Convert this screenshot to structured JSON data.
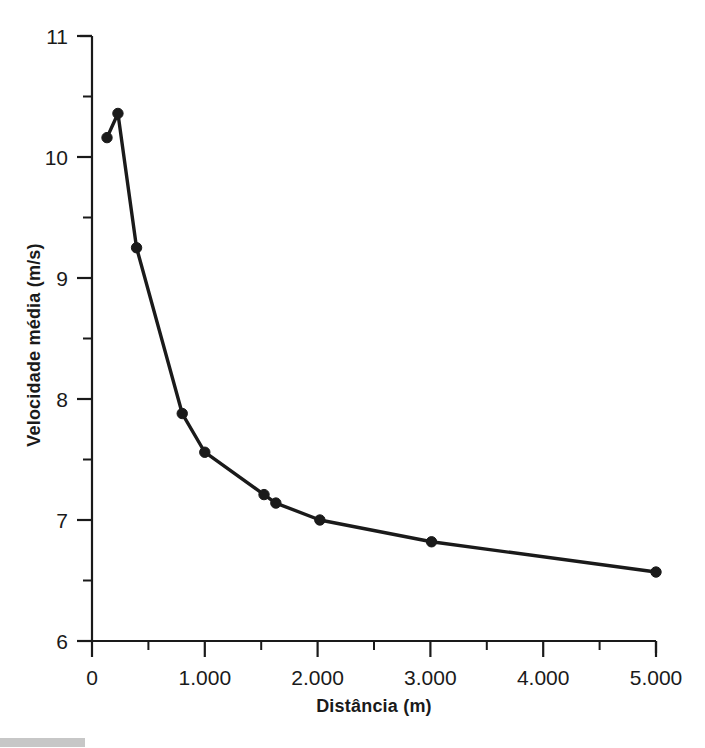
{
  "chart_data": {
    "type": "line",
    "title": "",
    "subtitle": "",
    "xlabel": "Distância (m)",
    "ylabel": "Velocidade média (m/s)",
    "xlim": [
      0,
      5000
    ],
    "ylim": [
      6,
      11
    ],
    "grid": false,
    "legend": null,
    "marker": "filled-circle",
    "line_color": "#1a1a1a",
    "marker_color": "#1a1a1a",
    "x_major_ticks": [
      0,
      1000,
      2000,
      3000,
      4000,
      5000
    ],
    "x_major_tick_labels": [
      "0",
      "1.000",
      "2.000",
      "3.000",
      "4.000",
      "5.000"
    ],
    "x_minor_ticks": [
      500,
      1500,
      2500,
      3500,
      4500
    ],
    "y_major_ticks": [
      6,
      7,
      8,
      9,
      10,
      11
    ],
    "y_major_tick_labels": [
      "6",
      "7",
      "8",
      "9",
      "10",
      "11"
    ],
    "y_minor_ticks": [
      6.5,
      7.5,
      8.5,
      9.5,
      10.5
    ],
    "series": [
      {
        "name": "Velocidade média",
        "x": [
          133,
          230,
          395,
          800,
          1000,
          1525,
          1630,
          2020,
          3010,
          5000
        ],
        "y": [
          10.16,
          10.36,
          9.25,
          7.88,
          7.56,
          7.21,
          7.14,
          7.0,
          6.82,
          6.57
        ]
      }
    ]
  },
  "axes": {
    "x_axis_name": "distance-axis",
    "y_axis_name": "velocity-axis"
  }
}
